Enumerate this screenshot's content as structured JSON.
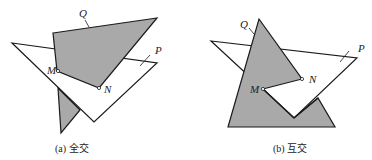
{
  "figures": [
    {
      "id": "a",
      "caption": "(a) 全交",
      "labels": {
        "Q": "Q",
        "P": "P",
        "M": "M",
        "N": "N"
      },
      "colors": {
        "fill_gray": "#a9a9a9",
        "stroke": "#1a1a1a",
        "fill_white": "#ffffff"
      }
    },
    {
      "id": "b",
      "caption": "(b) 互交",
      "labels": {
        "Q": "Q",
        "P": "P",
        "M": "M",
        "N": "N"
      },
      "colors": {
        "fill_gray": "#a9a9a9",
        "stroke": "#1a1a1a",
        "fill_white": "#ffffff"
      }
    }
  ]
}
